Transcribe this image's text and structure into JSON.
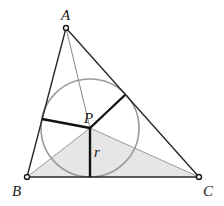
{
  "diagram": {
    "type": "incircle-triangle",
    "colors": {
      "triangle_stroke": "#2a2a2a",
      "circle_stroke": "#9a9a9a",
      "radius_stroke": "#111111",
      "bisector_stroke": "#888888",
      "shade_fill": "#e6e6e6",
      "label_color": "#1a1a1a"
    },
    "vertices": {
      "A": {
        "label": "A",
        "x": 66,
        "y": 28
      },
      "B": {
        "label": "B",
        "x": 27,
        "y": 177
      },
      "C": {
        "label": "C",
        "x": 199,
        "y": 177
      }
    },
    "incenter": {
      "label": "P",
      "x": 90,
      "y": 128
    },
    "incircle": {
      "cx": 90,
      "cy": 128,
      "r": 49
    },
    "radius_label": "r",
    "tangent_points": {
      "on_BC": {
        "x": 90,
        "y": 177
      },
      "on_AB": {
        "x": 42,
        "y": 119
      },
      "on_AC": {
        "x": 125,
        "y": 95
      }
    },
    "shaded_triangle": "BPC"
  }
}
